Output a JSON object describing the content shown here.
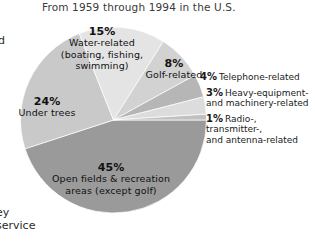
{
  "figure": {
    "title": "From 1959 through 1994 in the U.S.",
    "cropped_text": {
      "top_left": "d",
      "bottom_left_line1": "ey",
      "bottom_left_line2": "service"
    }
  },
  "chart_data": {
    "type": "pie",
    "title": "From 1959 through 1994 in the U.S.",
    "xlabel": "",
    "ylabel": "",
    "units": "percent",
    "legend_position": "on-slice and right",
    "grid": false,
    "categories": [
      "Open fields & recreation areas (except golf)",
      "Under trees",
      "Water-related (boating, fishing, swimming)",
      "Golf-related",
      "Telephone-related",
      "Heavy-equipment- and machinery-related",
      "Radio-, transmitter-, and antenna-related"
    ],
    "values": [
      45,
      24,
      15,
      8,
      4,
      3,
      1
    ],
    "colors": [
      "#9a9a9a",
      "#c9c9c9",
      "#e4e4e4",
      "#d2d2d2",
      "#b6b6b6",
      "#dcdcdc",
      "#c0c0c0"
    ],
    "slices": [
      {
        "pct_label": "45%",
        "description": "Open fields & recreation areas (except golf)",
        "desc_line1": "Open fields & recreation",
        "desc_line2": "areas (except golf)",
        "value": 45,
        "color": "#9a9a9a",
        "label_placement": "inside"
      },
      {
        "pct_label": "24%",
        "description": "Under trees",
        "desc_line1": "Under trees",
        "desc_line2": "",
        "value": 24,
        "color": "#c9c9c9",
        "label_placement": "inside"
      },
      {
        "pct_label": "15%",
        "description": "Water-related (boating, fishing, swimming)",
        "desc_line1": "Water-related",
        "desc_line2": "(boating, fishing,",
        "desc_line3": "swimming)",
        "value": 15,
        "color": "#e4e4e4",
        "label_placement": "inside"
      },
      {
        "pct_label": "8%",
        "description": "Golf-related",
        "desc_line1": "Golf-related",
        "desc_line2": "",
        "value": 8,
        "color": "#d2d2d2",
        "label_placement": "inside"
      },
      {
        "pct_label": "4%",
        "description": "Telephone-related",
        "desc_line1": "Telephone-related",
        "desc_line2": "",
        "value": 4,
        "color": "#b6b6b6",
        "label_placement": "right"
      },
      {
        "pct_label": "3%",
        "description": "Heavy-equipment- and machinery-related",
        "desc_line1": "Heavy-equipment-",
        "desc_line2": "and machinery-related",
        "value": 3,
        "color": "#dcdcdc",
        "label_placement": "right"
      },
      {
        "pct_label": "1%",
        "description": "Radio-, transmitter-, and antenna-related",
        "desc_line1": "Radio-, transmitter-,",
        "desc_line2": "and antenna-related",
        "value": 1,
        "color": "#c0c0c0",
        "label_placement": "right"
      }
    ]
  }
}
